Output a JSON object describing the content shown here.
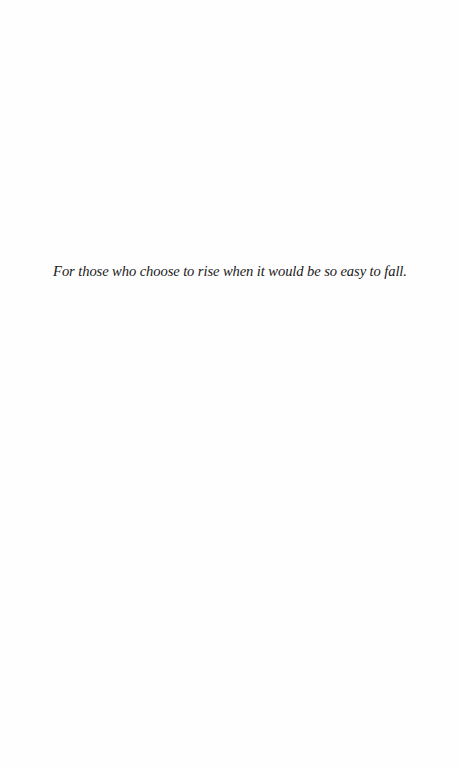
{
  "page": {
    "dedication": "For those who choose to rise when it would be so easy to fall."
  }
}
